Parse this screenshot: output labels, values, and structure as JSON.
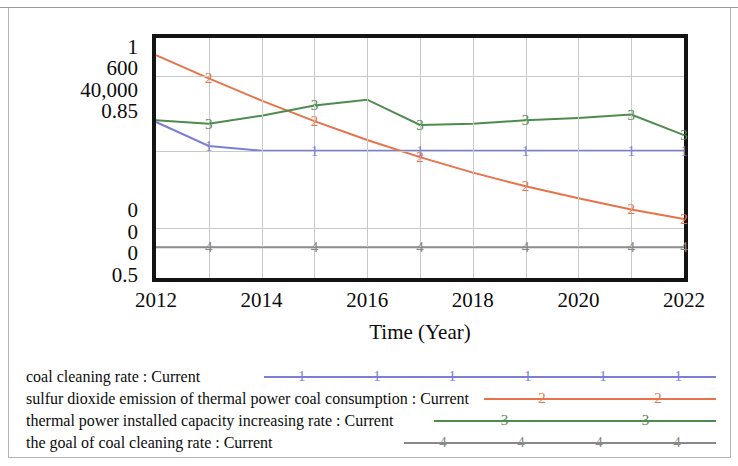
{
  "chart_data": {
    "type": "line",
    "title": "",
    "xlabel": "Time (Year)",
    "ylabel": "",
    "grid": true,
    "legend_position": "bottom",
    "x": [
      2012,
      2013,
      2014,
      2015,
      2016,
      2017,
      2018,
      2019,
      2020,
      2021,
      2022
    ],
    "xtick_labels": [
      "2012",
      "2014",
      "2016",
      "2018",
      "2020",
      "2022"
    ],
    "xtick_values": [
      2012,
      2014,
      2016,
      2018,
      2020,
      2022
    ],
    "xlim": [
      2012,
      2022
    ],
    "y_axis_scales": [
      {
        "index": 1,
        "series": "coal cleaning rate : Current",
        "top": "1",
        "bottom": "0",
        "color": "#7b7fd4"
      },
      {
        "index": 2,
        "series": "sulfur dioxide emission of thermal power coal consumption : Current",
        "top": "600",
        "bottom": "0",
        "color": "#e8724a"
      },
      {
        "index": 3,
        "series": "thermal power installed capacity increasing rate : Current",
        "top": "40,000",
        "bottom": "0",
        "color": "#4f8a4f"
      },
      {
        "index": 4,
        "series": "the goal of coal cleaning rate : Current",
        "top": "0.85",
        "bottom": "0.5",
        "color": "#888888"
      }
    ],
    "ytick_labels_top": [
      "1",
      "600",
      "40,000",
      "0.85"
    ],
    "ytick_labels_bottom": [
      "0",
      "0",
      "0",
      "0.5"
    ],
    "series": [
      {
        "id": "1",
        "name": "coal cleaning rate : Current",
        "marker": "1",
        "color": "#7b7fd4",
        "axis": 1,
        "values": [
          0.565,
          0.555,
          0.553,
          0.553,
          0.553,
          0.553,
          0.553,
          0.553,
          0.553,
          0.553,
          0.553
        ]
      },
      {
        "id": "2",
        "name": "sulfur dioxide emission of thermal power coal consumption : Current",
        "marker": "2",
        "color": "#e8724a",
        "axis": 2,
        "values": [
          520,
          466,
          414,
          366,
          322,
          282,
          246,
          214,
          186,
          160,
          138
        ]
      },
      {
        "id": "3",
        "name": "thermal power installed capacity increasing rate : Current",
        "marker": "3",
        "color": "#4f8a4f",
        "axis": 3,
        "values": [
          13800,
          13500,
          14200,
          15100,
          15600,
          13400,
          13500,
          13800,
          14000,
          14300,
          12500
        ]
      },
      {
        "id": "4",
        "name": "the goal of coal cleaning rate : Current",
        "marker": "4",
        "color": "#888888",
        "axis": 4,
        "values": [
          0.85,
          0.85,
          0.85,
          0.85,
          0.85,
          0.85,
          0.85,
          0.85,
          0.85,
          0.85,
          0.85
        ]
      }
    ]
  },
  "xaxis": {
    "title": "Time (Year)",
    "ticks": [
      {
        "label": "2012"
      },
      {
        "label": "2014"
      },
      {
        "label": "2016"
      },
      {
        "label": "2018"
      },
      {
        "label": "2020"
      },
      {
        "label": "2022"
      }
    ]
  },
  "yaxis": {
    "top_labels": [
      {
        "label": "1"
      },
      {
        "label": "600"
      },
      {
        "label": "40,000"
      },
      {
        "label": "0.85"
      }
    ],
    "bottom_labels": [
      {
        "label": "0"
      },
      {
        "label": "0"
      },
      {
        "label": "0"
      },
      {
        "label": "0.5"
      }
    ]
  },
  "legend": {
    "items": [
      {
        "label": "coal cleaning rate : Current",
        "marker": "1",
        "color": "#7b7fd4"
      },
      {
        "label": "sulfur dioxide emission of thermal power coal consumption : Current",
        "marker": "2",
        "color": "#e8724a"
      },
      {
        "label": "thermal power installed capacity increasing rate : Current",
        "marker": "3",
        "color": "#4f8a4f"
      },
      {
        "label": "the goal of coal cleaning rate : Current",
        "marker": "4",
        "color": "#888888"
      }
    ]
  }
}
